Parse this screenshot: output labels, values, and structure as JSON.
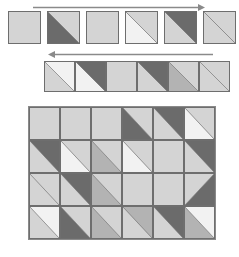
{
  "figure": {
    "background_color": "#ffffff",
    "border_color": "#6e6e6e",
    "palette": {
      "white": "#f2f2f2",
      "light": "#d4d4d4",
      "medium": "#b3b3b3",
      "dark": "#8a8a8a",
      "darker": "#6b6b6b"
    }
  },
  "arrows": [
    {
      "name": "top-arrow-right",
      "direction": "right",
      "label": "",
      "x": 33,
      "y": 3,
      "length": 172,
      "color": "#8a8a8a"
    },
    {
      "name": "second-arrow-left",
      "direction": "left",
      "label": "",
      "x": 48,
      "y": 50,
      "length": 165,
      "color": "#8a8a8a"
    }
  ],
  "rows": [
    {
      "name": "tile-strip-top",
      "x": 8,
      "y": 11,
      "tile_width": 33,
      "tile_height": 33,
      "gap": 6,
      "tiles": [
        {
          "split": "none",
          "lower": "light",
          "upper": "light"
        },
        {
          "split": "tlbr",
          "lower": "darker",
          "upper": "light"
        },
        {
          "split": "none",
          "lower": "light",
          "upper": "light"
        },
        {
          "split": "tlbr",
          "lower": "white",
          "upper": "light"
        },
        {
          "split": "tlbr",
          "lower": "light",
          "upper": "darker"
        },
        {
          "split": "tlbr",
          "lower": "light",
          "upper": "light"
        }
      ]
    },
    {
      "name": "tile-strip-second",
      "x": 44,
      "y": 61,
      "tile_width": 31,
      "tile_height": 31,
      "gap": 0,
      "tiles": [
        {
          "split": "tlbr",
          "lower": "light",
          "upper": "white"
        },
        {
          "split": "tlbr",
          "lower": "white",
          "upper": "darker"
        },
        {
          "split": "none",
          "lower": "light",
          "upper": "light"
        },
        {
          "split": "tlbr",
          "lower": "light",
          "upper": "darker"
        },
        {
          "split": "tlbr",
          "lower": "medium",
          "upper": "light"
        },
        {
          "split": "tlbr",
          "lower": "light",
          "upper": "light"
        }
      ]
    }
  ],
  "grid": {
    "name": "tile-grid",
    "x": 28,
    "y": 106,
    "columns": 6,
    "rows": 4,
    "tile_width": 31,
    "tile_height": 33,
    "cells": [
      [
        {
          "split": "none",
          "lower": "light",
          "upper": "light"
        },
        {
          "split": "none",
          "lower": "light",
          "upper": "light"
        },
        {
          "split": "none",
          "lower": "light",
          "upper": "light"
        },
        {
          "split": "tlbr",
          "lower": "darker",
          "upper": "light"
        },
        {
          "split": "tlbr",
          "lower": "light",
          "upper": "darker"
        },
        {
          "split": "tlbr",
          "lower": "white",
          "upper": "light"
        }
      ],
      [
        {
          "split": "tlbr",
          "lower": "light",
          "upper": "darker"
        },
        {
          "split": "tlbr",
          "lower": "white",
          "upper": "light"
        },
        {
          "split": "tlbr",
          "lower": "medium",
          "upper": "light"
        },
        {
          "split": "tlbr",
          "lower": "white",
          "upper": "light"
        },
        {
          "split": "none",
          "lower": "light",
          "upper": "light"
        },
        {
          "split": "tlbr",
          "lower": "light",
          "upper": "darker"
        }
      ],
      [
        {
          "split": "tlbr",
          "lower": "light",
          "upper": "light"
        },
        {
          "split": "tlbr",
          "lower": "light",
          "upper": "darker"
        },
        {
          "split": "tlbr",
          "lower": "medium",
          "upper": "light"
        },
        {
          "split": "none",
          "lower": "light",
          "upper": "light"
        },
        {
          "split": "none",
          "lower": "light",
          "upper": "light"
        },
        {
          "split": "trbl",
          "lower": "darker",
          "upper": "light"
        }
      ],
      [
        {
          "split": "tlbr",
          "lower": "light",
          "upper": "white"
        },
        {
          "split": "tlbr",
          "lower": "darker",
          "upper": "light"
        },
        {
          "split": "tlbr",
          "lower": "medium",
          "upper": "light"
        },
        {
          "split": "tlbr",
          "lower": "light",
          "upper": "medium"
        },
        {
          "split": "tlbr",
          "lower": "light",
          "upper": "darker"
        },
        {
          "split": "tlbr",
          "lower": "medium",
          "upper": "white"
        }
      ]
    ]
  }
}
